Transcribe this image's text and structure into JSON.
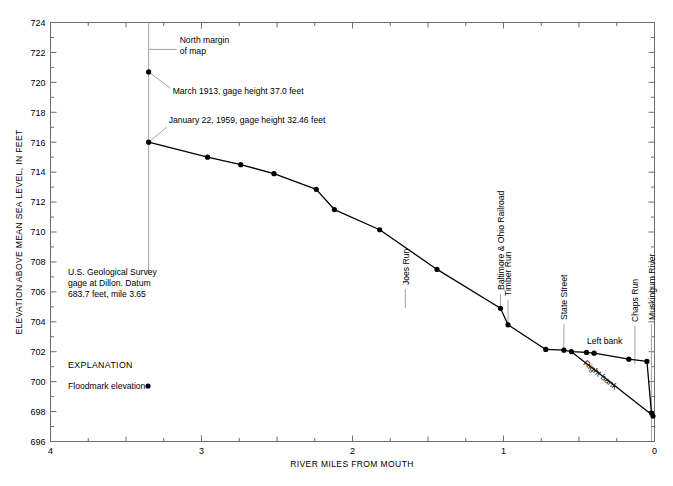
{
  "chart_data": {
    "type": "line",
    "title": "",
    "xlabel": "RIVER MILES FROM MOUTH",
    "ylabel": "ELEVATION ABOVE MEAN SEA LEVEL, IN FEET",
    "xlim": [
      4,
      0
    ],
    "ylim": [
      696,
      724
    ],
    "x_ticks": [
      "4",
      "3",
      "2",
      "1",
      "0"
    ],
    "x_tick_values": [
      4,
      3,
      2,
      1,
      0
    ],
    "x_minor_step": 0.25,
    "y_ticks": [
      "696",
      "698",
      "700",
      "702",
      "704",
      "706",
      "708",
      "710",
      "712",
      "714",
      "716",
      "718",
      "720",
      "722",
      "724"
    ],
    "y_tick_values": [
      696,
      698,
      700,
      702,
      704,
      706,
      708,
      710,
      712,
      714,
      716,
      718,
      720,
      722,
      724
    ],
    "y_minor_step": 1,
    "grid": false,
    "legend_position": "inside-lower-left",
    "series": [
      {
        "name": "Left bank",
        "marker": "filled-circle",
        "x": [
          3.35,
          2.96,
          2.74,
          2.52,
          2.24,
          2.12,
          1.82,
          1.44,
          1.02,
          0.97,
          0.72,
          0.6,
          0.55,
          0.45,
          0.4,
          0.17,
          0.05,
          0.02,
          0.01
        ],
        "y": [
          716.0,
          715.0,
          714.5,
          713.9,
          712.85,
          711.5,
          710.15,
          707.5,
          704.9,
          703.8,
          702.15,
          702.1,
          702.0,
          701.95,
          701.9,
          701.5,
          701.35,
          697.9,
          697.7
        ]
      },
      {
        "name": "Right bank",
        "marker": "none",
        "x": [
          0.55,
          0.02
        ],
        "y": [
          702.0,
          697.8
        ]
      },
      {
        "name": "March 1913 floodmark",
        "marker": "filled-circle",
        "x": [
          3.35
        ],
        "y": [
          720.7
        ]
      }
    ],
    "annotations": [
      {
        "text": "North margin of map",
        "lines": [
          "North margin",
          "of map"
        ],
        "x": 3.35,
        "y": 724.0
      },
      {
        "text": "March 1913, gage height 37.0 feet",
        "x": 3.35,
        "y": 720.7
      },
      {
        "text": "January 22, 1959, gage height 32.46 feet",
        "x": 3.35,
        "y": 716.0
      },
      {
        "text": "U.S. Geological Survey gage at Dillon.  Datum 683.7 feet, mile 3.65",
        "lines": [
          "U.S. Geological Survey",
          "gage at Dillon.  Datum",
          "683.7 feet, mile 3.65"
        ],
        "x": 3.35,
        "y": 707.2
      }
    ],
    "feature_labels": [
      {
        "text": "Joes Run",
        "x": 1.65
      },
      {
        "text": "Baltimore & Ohio Railroad",
        "x": 1.02
      },
      {
        "text": "Timber Run",
        "x": 0.97
      },
      {
        "text": "State Street",
        "x": 0.6
      },
      {
        "text": "Chaps Run",
        "x": 0.13
      },
      {
        "text": "Muskingum River",
        "x": 0.02
      }
    ],
    "inline_labels": [
      {
        "text": "Left bank",
        "x": 0.33,
        "y": 702.5
      },
      {
        "text": "Right bank",
        "x": 0.37,
        "y": 700.3
      }
    ]
  },
  "legend": {
    "title": "EXPLANATION",
    "items": [
      {
        "label": "Floodmark elevation",
        "marker": "filled-circle"
      }
    ]
  },
  "axes": {
    "x_title": "RIVER MILES FROM MOUTH",
    "y_title": "ELEVATION ABOVE MEAN SEA LEVEL, IN FEET"
  },
  "caption": {
    "text": ""
  },
  "colors": {
    "line": "#000000",
    "marker": "#000000",
    "frame": "#6e6e6e",
    "leader": "#9a9a9a",
    "background": "#ffffff"
  }
}
